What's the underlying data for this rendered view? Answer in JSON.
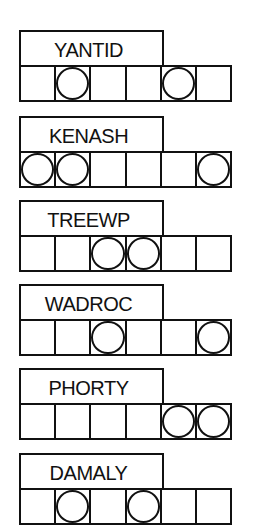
{
  "puzzles": [
    {
      "scrambled": "YANTID",
      "circled_positions": [
        2,
        5
      ],
      "top": 30
    },
    {
      "scrambled": "KENASH",
      "circled_positions": [
        1,
        2,
        6
      ],
      "top": 116
    },
    {
      "scrambled": "TREEWP",
      "circled_positions": [
        3,
        4
      ],
      "top": 200
    },
    {
      "scrambled": "WADROC",
      "circled_positions": [
        3,
        6
      ],
      "top": 284
    },
    {
      "scrambled": "PHORTY",
      "circled_positions": [
        5,
        6
      ],
      "top": 368
    },
    {
      "scrambled": "DAMALY",
      "circled_positions": [
        2,
        4
      ],
      "top": 453
    }
  ],
  "cell_count": 6,
  "colors": {
    "ink": "#111111",
    "paper": "#ffffff"
  }
}
